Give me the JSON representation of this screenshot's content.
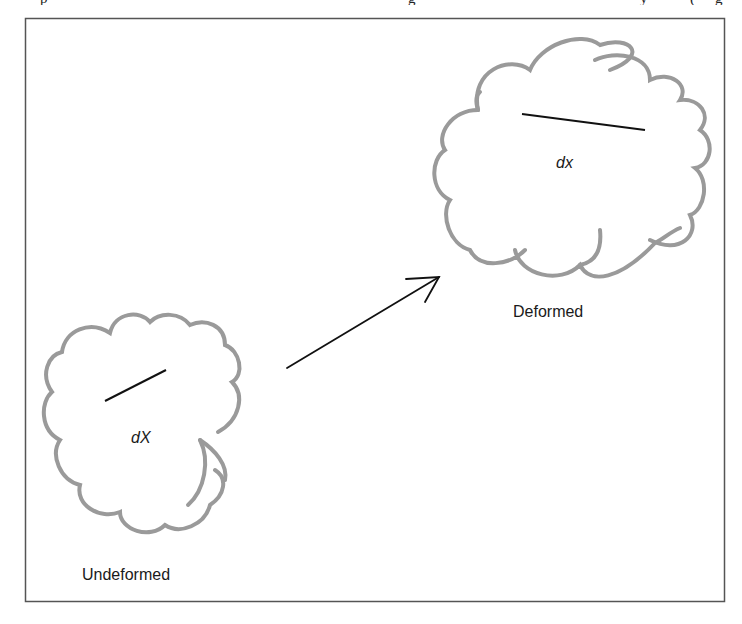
{
  "diagram": {
    "frame": {
      "x": 25,
      "y": 18,
      "width": 699,
      "height": 583,
      "stroke": "#555555"
    },
    "clipped_caption_fragments": [
      "p",
      "g",
      "y",
      "(",
      "g"
    ],
    "undeformed": {
      "label": "Undeformed",
      "segment_label": "dX",
      "outline_color": "#9a9a9a",
      "segment": {
        "x1": 105,
        "y1": 401,
        "x2": 166,
        "y2": 370
      }
    },
    "deformed": {
      "label": "Deformed",
      "segment_label": "dx",
      "outline_color": "#9a9a9a",
      "segment": {
        "x1": 522,
        "y1": 114,
        "x2": 645,
        "y2": 130
      }
    },
    "arrow": {
      "x1": 287,
      "y1": 368,
      "x2": 439,
      "y2": 277,
      "color": "#111111"
    }
  }
}
